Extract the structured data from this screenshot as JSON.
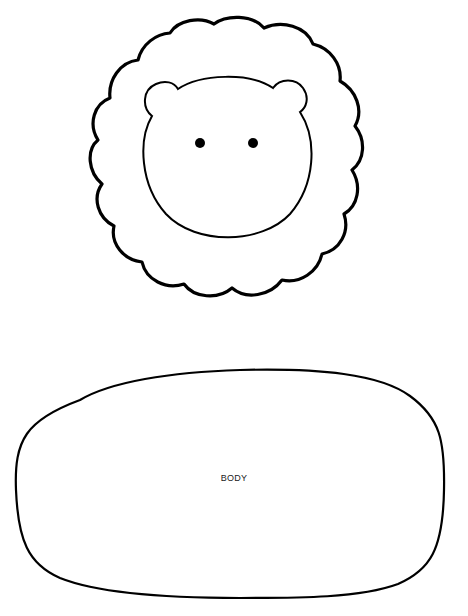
{
  "pattern": {
    "pieces": [
      {
        "id": "head",
        "parts": [
          "mane",
          "face",
          "left-ear",
          "right-ear",
          "left-eye",
          "right-eye"
        ]
      },
      {
        "id": "body",
        "label": "BODY"
      }
    ]
  },
  "colors": {
    "background": "#ffffff",
    "stroke": "#000000"
  }
}
